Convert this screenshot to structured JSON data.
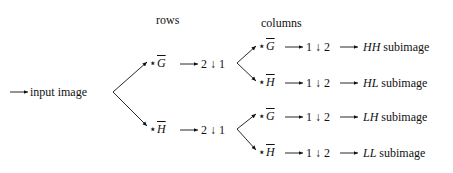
{
  "headers": {
    "rows": "rows",
    "columns": "columns"
  },
  "input": {
    "label": "input image"
  },
  "filters": {
    "G": "G",
    "H": "H",
    "star": "⋆"
  },
  "row_stage": [
    {
      "filter": "G",
      "downsample": "2 ↓ 1"
    },
    {
      "filter": "H",
      "downsample": "2 ↓ 1"
    }
  ],
  "column_stage": [
    {
      "filter": "G",
      "downsample": "1 ↓ 2",
      "output_code": "HH",
      "output_label": "subimage"
    },
    {
      "filter": "H",
      "downsample": "1 ↓ 2",
      "output_code": "HL",
      "output_label": "subimage"
    },
    {
      "filter": "G",
      "downsample": "1 ↓ 2",
      "output_code": "LH",
      "output_label": "subimage"
    },
    {
      "filter": "H",
      "downsample": "1 ↓ 2",
      "output_code": "LL",
      "output_label": "subimage"
    }
  ]
}
